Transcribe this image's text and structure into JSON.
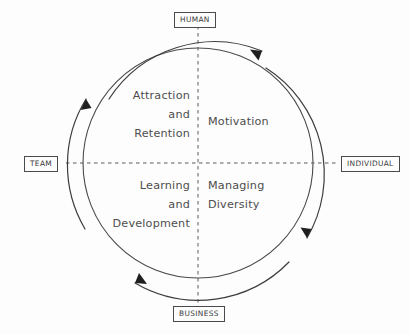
{
  "diagram": {
    "type": "cycle-quadrant",
    "title": "",
    "background_color": "#fdfdfd",
    "line_color": "#4a4a4a",
    "text_color": "#4d4d4d",
    "circle": {
      "center_x": 198,
      "center_y": 163,
      "radius": 115
    },
    "axis_labels": {
      "top": "HUMAN",
      "left": "TEAM",
      "right": "INDIVIDUAL",
      "bottom": "BUSINESS"
    },
    "quadrants": [
      {
        "position": "top-left",
        "lines": [
          "Attraction",
          "and",
          "Retention"
        ]
      },
      {
        "position": "top-right",
        "lines": [
          "Motivation"
        ]
      },
      {
        "position": "bottom-left",
        "lines": [
          "Learning",
          "and",
          "Development"
        ]
      },
      {
        "position": "bottom-right",
        "lines": [
          "Managing",
          "Diversity"
        ]
      }
    ],
    "arrows": [
      {
        "name": "top-arrow",
        "direction": "clockwise",
        "points": "right"
      },
      {
        "name": "right-arrow",
        "direction": "clockwise",
        "points": "down"
      },
      {
        "name": "bottom-arrow",
        "direction": "clockwise",
        "points": "left"
      },
      {
        "name": "left-arrow",
        "direction": "clockwise",
        "points": "up"
      }
    ]
  }
}
